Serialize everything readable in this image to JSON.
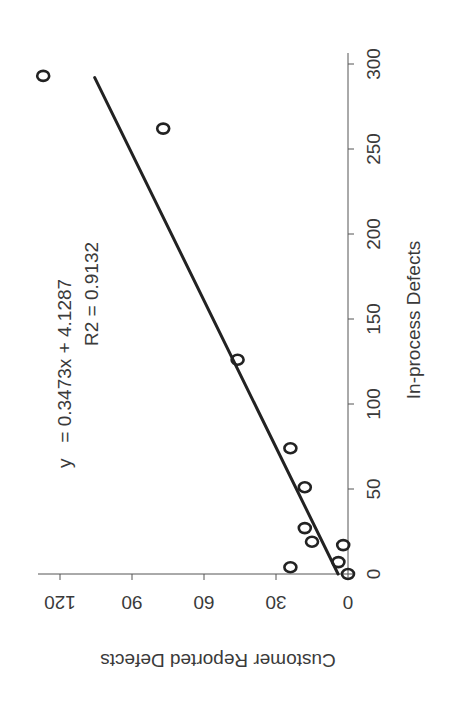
{
  "chart_data": {
    "type": "scatter",
    "orientation": "rotated-90-ccw",
    "title": "",
    "xlabel": "In-process Defects",
    "ylabel": "Customer Reported Defects",
    "xlim": [
      0,
      300
    ],
    "ylim": [
      0,
      120
    ],
    "xticks": [
      "0",
      "50",
      "100",
      "150",
      "200",
      "250",
      "300"
    ],
    "yticks": [
      "0",
      "30",
      "60",
      "90",
      "120"
    ],
    "grid": false,
    "legend": "none",
    "series": [
      {
        "name": "Observed",
        "marker": "open-circle",
        "points": [
          {
            "x": 0,
            "y": 0
          },
          {
            "x": 4,
            "y": 24
          },
          {
            "x": 7,
            "y": 4
          },
          {
            "x": 17,
            "y": 2
          },
          {
            "x": 19,
            "y": 15
          },
          {
            "x": 27,
            "y": 18
          },
          {
            "x": 51,
            "y": 18
          },
          {
            "x": 74,
            "y": 24
          },
          {
            "x": 126,
            "y": 46
          },
          {
            "x": 262,
            "y": 77
          },
          {
            "x": 293,
            "y": 127
          }
        ]
      },
      {
        "name": "Linear fit",
        "type": "line",
        "slope": 0.3473,
        "intercept": 4.1287,
        "x_range": [
          0,
          292
        ]
      }
    ],
    "annotations": {
      "equation": "y   = 0.3473x + 4.1287",
      "r_squared": "R2 = 0.9132"
    }
  }
}
